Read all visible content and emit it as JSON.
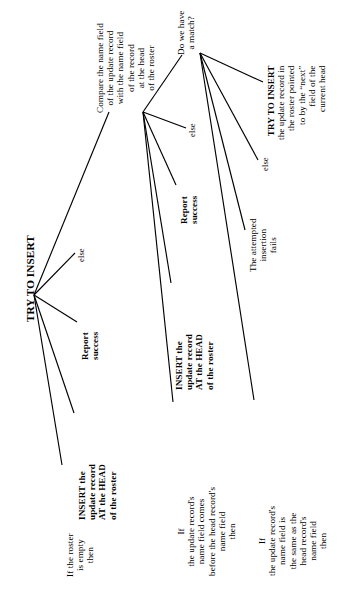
{
  "diagram": {
    "orientation": "rotated-90-ccw",
    "stroke_color": "#000000",
    "background_color": "#ffffff",
    "nodes": {
      "root": {
        "id": "try-to-insert-root",
        "lines": [
          "TRY TO INSERT"
        ]
      },
      "if_roster_empty": {
        "id": "if-roster-empty",
        "lines": [
          "If the roster",
          "is empty",
          "then"
        ]
      },
      "insert_head_1": {
        "id": "insert-at-head-first",
        "lines": [
          "INSERT the",
          "update record",
          "AT the HEAD",
          "of the roster"
        ]
      },
      "report_success_1": {
        "id": "report-success-first",
        "lines": [
          "Report",
          "success"
        ]
      },
      "else_1": {
        "id": "else-root",
        "lines": [
          "else"
        ]
      },
      "compare": {
        "id": "compare-name-fields",
        "lines": [
          "Compare the name field",
          "of the update record",
          "with the name field",
          "of the record",
          "at the head",
          "of the roster"
        ]
      },
      "if_comes_before": {
        "id": "if-name-comes-before",
        "lines": [
          "If",
          "the update record's",
          "name field comes",
          "before the head record's",
          "name field",
          "then"
        ]
      },
      "insert_head_2": {
        "id": "insert-at-head-second",
        "lines": [
          "INSERT the",
          "update record",
          "AT the HEAD",
          "of the roster"
        ]
      },
      "report_success_2": {
        "id": "report-success-second",
        "lines": [
          "Report",
          "success"
        ]
      },
      "else_2": {
        "id": "else-compare",
        "lines": [
          "else"
        ]
      },
      "do_we_have_match": {
        "id": "do-we-have-a-match",
        "lines": [
          "Do we have",
          "a match?"
        ]
      },
      "if_same_as_head": {
        "id": "if-name-same-as-head",
        "lines": [
          "If",
          "the update record's",
          "name field is",
          "the same as the",
          "head record's",
          "name field",
          "then"
        ]
      },
      "insertion_fails": {
        "id": "attempted-insertion-fails",
        "lines": [
          "The attempted",
          "insertion",
          "fails"
        ]
      },
      "else_3": {
        "id": "else-match",
        "lines": [
          "else"
        ]
      },
      "try_to_insert_next": {
        "id": "try-to-insert-next-recursive",
        "lines": [
          "TRY TO INSERT",
          "the update record in",
          "the roster pointed",
          "to by the “next”",
          "field of the",
          "current head"
        ]
      }
    }
  }
}
